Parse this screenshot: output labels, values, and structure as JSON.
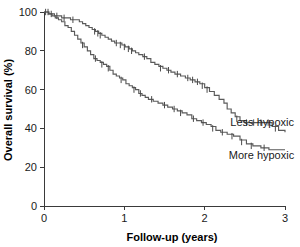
{
  "chart_data": {
    "type": "line",
    "subtype": "kaplan-meier-survival",
    "title": "",
    "xlabel": "Follow-up (years)",
    "ylabel": "Overall survival (%)",
    "xlim": [
      0,
      3
    ],
    "ylim": [
      0,
      100
    ],
    "xticks": [
      0,
      1,
      2,
      3
    ],
    "xtick_labels": [
      "0",
      "1",
      "2",
      "3"
    ],
    "yticks": [
      0,
      20,
      40,
      60,
      80,
      100
    ],
    "ytick_labels": [
      "0",
      "20",
      "40",
      "60",
      "80",
      "100"
    ],
    "grid": false,
    "legend_position": "inline-right",
    "line_color": "#5a5a5a",
    "censor_marker": "plus-tick",
    "series": [
      {
        "name": "Less hypoxic",
        "label": "Less hypoxic",
        "label_x": 2.32,
        "label_y": 41,
        "color": "#5a5a5a",
        "points": [
          [
            0.0,
            100
          ],
          [
            0.04,
            100
          ],
          [
            0.06,
            99
          ],
          [
            0.1,
            99
          ],
          [
            0.13,
            98
          ],
          [
            0.18,
            98
          ],
          [
            0.22,
            97
          ],
          [
            0.27,
            97
          ],
          [
            0.33,
            96
          ],
          [
            0.4,
            96
          ],
          [
            0.44,
            95
          ],
          [
            0.48,
            94
          ],
          [
            0.52,
            93
          ],
          [
            0.56,
            92
          ],
          [
            0.6,
            91
          ],
          [
            0.64,
            90
          ],
          [
            0.68,
            89
          ],
          [
            0.72,
            88
          ],
          [
            0.76,
            87
          ],
          [
            0.8,
            86
          ],
          [
            0.84,
            85
          ],
          [
            0.88,
            84
          ],
          [
            0.93,
            84
          ],
          [
            0.97,
            83
          ],
          [
            1.01,
            82
          ],
          [
            1.06,
            81
          ],
          [
            1.1,
            80
          ],
          [
            1.14,
            79
          ],
          [
            1.18,
            78
          ],
          [
            1.23,
            77
          ],
          [
            1.28,
            76
          ],
          [
            1.33,
            74
          ],
          [
            1.38,
            73
          ],
          [
            1.43,
            72
          ],
          [
            1.48,
            71
          ],
          [
            1.53,
            70
          ],
          [
            1.58,
            69
          ],
          [
            1.63,
            68
          ],
          [
            1.7,
            67
          ],
          [
            1.76,
            66
          ],
          [
            1.82,
            65
          ],
          [
            1.88,
            64
          ],
          [
            1.94,
            63
          ],
          [
            2.0,
            61
          ],
          [
            2.06,
            59
          ],
          [
            2.12,
            57
          ],
          [
            2.18,
            55
          ],
          [
            2.24,
            53
          ],
          [
            2.28,
            50
          ],
          [
            2.33,
            48
          ],
          [
            2.38,
            46
          ],
          [
            2.44,
            44
          ],
          [
            2.5,
            43
          ],
          [
            2.6,
            43
          ],
          [
            2.7,
            43
          ],
          [
            2.78,
            43
          ],
          [
            2.84,
            41
          ],
          [
            2.92,
            39
          ],
          [
            3.0,
            38
          ]
        ],
        "censored": [
          [
            0.05,
            100
          ],
          [
            0.09,
            99
          ],
          [
            0.16,
            98
          ],
          [
            0.25,
            97
          ],
          [
            0.36,
            96
          ],
          [
            0.63,
            90
          ],
          [
            0.67,
            89
          ],
          [
            0.7,
            88
          ],
          [
            0.9,
            84
          ],
          [
            0.95,
            83
          ],
          [
            1.0,
            82
          ],
          [
            1.05,
            81
          ],
          [
            1.09,
            80
          ],
          [
            1.25,
            77
          ],
          [
            1.45,
            71
          ],
          [
            1.55,
            70
          ],
          [
            1.66,
            68
          ],
          [
            1.79,
            66
          ],
          [
            1.85,
            65
          ],
          [
            1.91,
            64
          ],
          [
            1.97,
            62
          ],
          [
            2.03,
            60
          ],
          [
            2.4,
            45
          ],
          [
            2.52,
            43
          ],
          [
            2.61,
            43
          ],
          [
            2.7,
            43
          ],
          [
            2.79,
            43
          ],
          [
            2.88,
            40
          ]
        ]
      },
      {
        "name": "More hypoxic",
        "label": "More hypoxic",
        "label_x": 2.3,
        "label_y": 24,
        "color": "#5a5a5a",
        "points": [
          [
            0.0,
            100
          ],
          [
            0.03,
            100
          ],
          [
            0.06,
            99
          ],
          [
            0.1,
            98
          ],
          [
            0.14,
            97
          ],
          [
            0.18,
            96
          ],
          [
            0.22,
            95
          ],
          [
            0.26,
            93
          ],
          [
            0.3,
            92
          ],
          [
            0.34,
            90
          ],
          [
            0.38,
            88
          ],
          [
            0.42,
            86
          ],
          [
            0.46,
            84
          ],
          [
            0.5,
            82
          ],
          [
            0.54,
            80
          ],
          [
            0.58,
            78
          ],
          [
            0.62,
            76
          ],
          [
            0.66,
            75
          ],
          [
            0.7,
            74
          ],
          [
            0.74,
            73
          ],
          [
            0.78,
            72
          ],
          [
            0.82,
            70
          ],
          [
            0.86,
            68
          ],
          [
            0.9,
            67
          ],
          [
            0.94,
            66
          ],
          [
            0.98,
            65
          ],
          [
            1.02,
            63
          ],
          [
            1.06,
            62
          ],
          [
            1.1,
            61
          ],
          [
            1.14,
            60
          ],
          [
            1.18,
            58
          ],
          [
            1.22,
            57
          ],
          [
            1.26,
            56
          ],
          [
            1.3,
            55
          ],
          [
            1.36,
            54
          ],
          [
            1.42,
            53
          ],
          [
            1.48,
            52
          ],
          [
            1.54,
            51
          ],
          [
            1.6,
            50
          ],
          [
            1.66,
            49
          ],
          [
            1.72,
            48
          ],
          [
            1.78,
            47
          ],
          [
            1.84,
            45
          ],
          [
            1.9,
            44
          ],
          [
            1.96,
            43
          ],
          [
            2.02,
            42
          ],
          [
            2.08,
            41
          ],
          [
            2.14,
            39
          ],
          [
            2.2,
            38
          ],
          [
            2.28,
            37
          ],
          [
            2.36,
            36
          ],
          [
            2.44,
            34
          ],
          [
            2.52,
            32
          ],
          [
            2.6,
            31
          ],
          [
            2.7,
            30
          ],
          [
            2.8,
            29
          ],
          [
            2.9,
            29
          ],
          [
            3.0,
            29
          ]
        ],
        "censored": [
          [
            0.02,
            100
          ],
          [
            0.48,
            83
          ],
          [
            0.64,
            76
          ],
          [
            0.72,
            73
          ],
          [
            0.8,
            71
          ],
          [
            0.96,
            65
          ],
          [
            1.12,
            60
          ],
          [
            1.2,
            58
          ],
          [
            1.34,
            55
          ],
          [
            1.5,
            52
          ],
          [
            1.62,
            50
          ],
          [
            1.7,
            48
          ],
          [
            1.86,
            45
          ],
          [
            1.98,
            43
          ],
          [
            2.1,
            40
          ],
          [
            2.22,
            38
          ],
          [
            2.34,
            36
          ],
          [
            2.46,
            33
          ],
          [
            2.58,
            31
          ],
          [
            2.74,
            30
          ]
        ]
      }
    ]
  },
  "axes": {
    "x_title": "Follow-up (years)",
    "y_title": "Overall survival (%)"
  }
}
